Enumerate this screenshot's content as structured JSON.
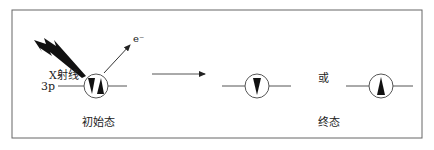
{
  "initial": {
    "ray_label": "X射线",
    "orbital_label": "3p",
    "electron_label": "e⁻",
    "state_label": "初始态"
  },
  "final": {
    "or_label": "或",
    "state_label": "终态"
  },
  "colors": {
    "line": "#555555",
    "fill": "#111111",
    "border": "#666666"
  }
}
